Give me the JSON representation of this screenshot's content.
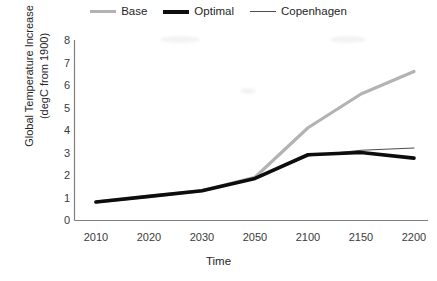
{
  "chart_data": {
    "type": "line",
    "title": "",
    "xlabel": "Time",
    "ylabel": "Global Temperature Increase (degC from 1900)",
    "ylabel_line1": "Global Temperature Increase",
    "ylabel_line2": "(degC from 1900)",
    "categories": [
      "2010",
      "2020",
      "2030",
      "2050",
      "2100",
      "2150",
      "2200"
    ],
    "x": [
      2010,
      2020,
      2030,
      2050,
      2100,
      2150,
      2200
    ],
    "ylim": [
      0,
      8
    ],
    "yticks": [
      "8",
      "7",
      "6",
      "5",
      "4",
      "3",
      "2",
      "1",
      "0"
    ],
    "ytick_values": [
      8,
      7,
      6,
      5,
      4,
      3,
      2,
      1,
      0
    ],
    "grid": false,
    "legend_position": "top-center",
    "series": [
      {
        "name": "Base",
        "color": "#b3b3b3",
        "width": 3.2,
        "values": [
          0.8,
          1.05,
          1.3,
          1.9,
          4.1,
          5.6,
          6.6
        ]
      },
      {
        "name": "Optimal",
        "color": "#0d0d0d",
        "width": 3.6,
        "values": [
          0.8,
          1.05,
          1.3,
          1.85,
          2.9,
          3.0,
          2.75
        ]
      },
      {
        "name": "Copenhagen",
        "color": "#4d4d4d",
        "width": 1.1,
        "values": [
          0.8,
          1.05,
          1.3,
          1.85,
          2.85,
          3.1,
          3.2
        ]
      }
    ]
  },
  "legend": {
    "entries": [
      {
        "label": "Base"
      },
      {
        "label": "Optimal"
      },
      {
        "label": "Copenhagen"
      }
    ]
  },
  "axes": {
    "x_title": "Time",
    "y_title_line1": "Global Temperature Increase",
    "y_title_line2": "(degC from 1900)"
  }
}
